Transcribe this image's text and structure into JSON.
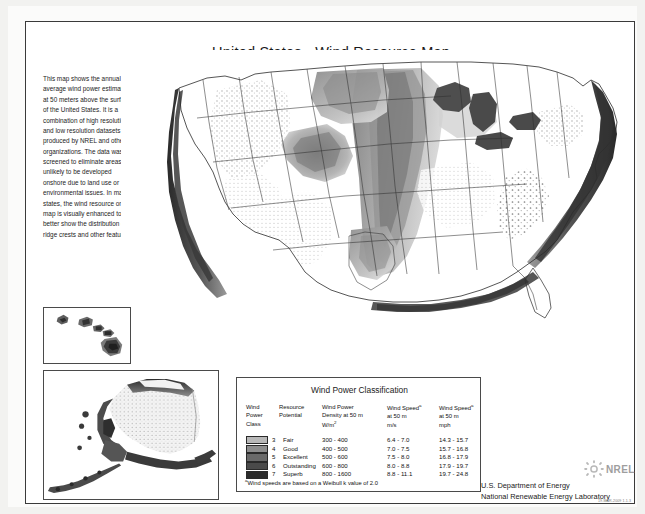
{
  "page": {
    "title": "United States - Wind Resource Map",
    "background_color": "#f2f2f0",
    "sheet_color": "#fbfbfa",
    "frame_color": "#3a3a3a"
  },
  "description": {
    "text": "This map shows the annual average wind power estimates at 50 meters above the surface of the United States.  It is a combination of high resolution and low resolution datasets produced by NREL and other organizations.  The data was screened to eliminate areas unlikely to be developed onshore due to land use or environmental  issues.  In many states, the wind resource on this map is visually enhanced to better show the distribution on ridge crests and other features."
  },
  "insets": {
    "hawaii": {
      "name": "Hawaii"
    },
    "alaska": {
      "name": "Alaska"
    }
  },
  "legend": {
    "title": "Wind Power Classification",
    "headers": {
      "class": "Wind Power Class",
      "potential": "Resource Potential",
      "density": "Wind Power Density at 50 m W/m",
      "density_sup": "2",
      "speed_ms": "Wind Speed",
      "speed_ms_sup": "a",
      "speed_ms_sub": "at 50 m m/s",
      "speed_mph": "Wind Speed",
      "speed_mph_sup": "a",
      "speed_mph_sub": "at 50 m mph"
    },
    "header_lines": {
      "class_l1": "Wind",
      "class_l2": "Power",
      "class_l3": "Class",
      "potential_l1": "Resource",
      "potential_l2": "Potential",
      "density_l1": "Wind Power",
      "density_l2": "Density at 50 m",
      "density_l3": "W/m",
      "ms_l1": "Wind Speed",
      "ms_l2": "at 50 m",
      "ms_l3": "m/s",
      "mph_l1": "Wind Speed",
      "mph_l2": "at 50 m",
      "mph_l3": "mph"
    },
    "rows": [
      {
        "class": "3",
        "potential": "Fair",
        "density": "300 -  400",
        "speed_ms": "6.4 -  7.0",
        "speed_mph": "14.3 - 15.7",
        "color": "#b8b8b8"
      },
      {
        "class": "4",
        "potential": "Good",
        "density": "400 -  500",
        "speed_ms": "7.0 -  7.5",
        "speed_mph": "15.7 - 16.8",
        "color": "#8e8e8e"
      },
      {
        "class": "5",
        "potential": "Excellent",
        "density": "500 -  600",
        "speed_ms": "7.5 -  8.0",
        "speed_mph": "16.8 - 17.9",
        "color": "#6a6a6a"
      },
      {
        "class": "6",
        "potential": "Outstanding",
        "density": "600 -  800",
        "speed_ms": "8.0 -  8.8",
        "speed_mph": "17.9 - 19.7",
        "color": "#4a4a4a"
      },
      {
        "class": "7",
        "potential": "Superb",
        "density": "800 - 1600",
        "speed_ms": "8.8 - 11.1",
        "speed_mph": "19.7 - 24.8",
        "color": "#2b2b2b"
      }
    ],
    "note_sup": "a",
    "note": "Wind speeds are based on a Weibull k value of 2.0"
  },
  "footer": {
    "line1": "U.S. Department of Energy",
    "line2": "National Renewable Energy Laboratory",
    "logo_text": "NREL",
    "datestamp": "19-MAR-2009 1.1.3"
  }
}
